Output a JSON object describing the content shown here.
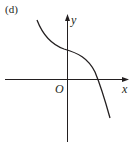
{
  "figure": {
    "panel_label": "(d)",
    "x_axis_label": "x",
    "y_axis_label": "y",
    "origin_label": "O",
    "stroke_color": "#231f20",
    "background": "#ffffff"
  },
  "curve": {
    "description": "decreasing cubic-like curve with inflection near the y-axis, positive y-intercept, crossing x-axis at positive x",
    "shape": "decreasing-cubic"
  }
}
